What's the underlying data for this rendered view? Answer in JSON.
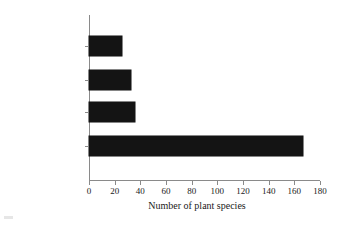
{
  "chart_data": {
    "type": "bar",
    "orientation": "horizontal",
    "title": "",
    "xlabel": "Number of plant species",
    "ylabel": "",
    "categories": [
      "Rupestrian fields",
      "Dry forest",
      "Exotic",
      "Cerrado"
    ],
    "values": [
      26,
      33,
      36,
      167
    ],
    "xlim": [
      0,
      180
    ],
    "xticks": [
      0,
      20,
      40,
      60,
      80,
      100,
      120,
      140,
      160,
      180
    ],
    "xticklabels": [
      "0",
      "20",
      "40",
      "60",
      "80",
      "100",
      "120",
      "140",
      "160",
      "180"
    ],
    "grid": false,
    "legend": false,
    "bar_color": "#141414",
    "axis_color": "#8a8a8a",
    "background": "#ffffff"
  }
}
